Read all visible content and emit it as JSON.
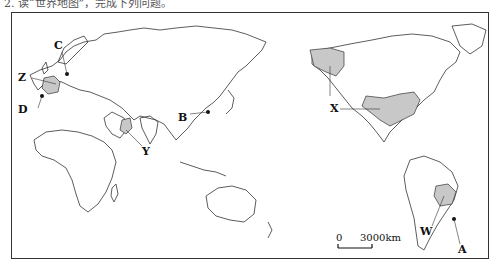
{
  "header": {
    "partial_text": "2.  读“世界地图”，完成下列问题。"
  },
  "map": {
    "labels": {
      "A": "A",
      "B": "B",
      "C": "C",
      "D": "D",
      "W": "W",
      "X": "X",
      "Y": "Y",
      "Z": "Z"
    },
    "scale_bar": {
      "start": "0",
      "end": "3000km"
    },
    "colors": {
      "shaded": "#c8c8c8",
      "outline": "#333333",
      "frame": "#333333"
    }
  }
}
